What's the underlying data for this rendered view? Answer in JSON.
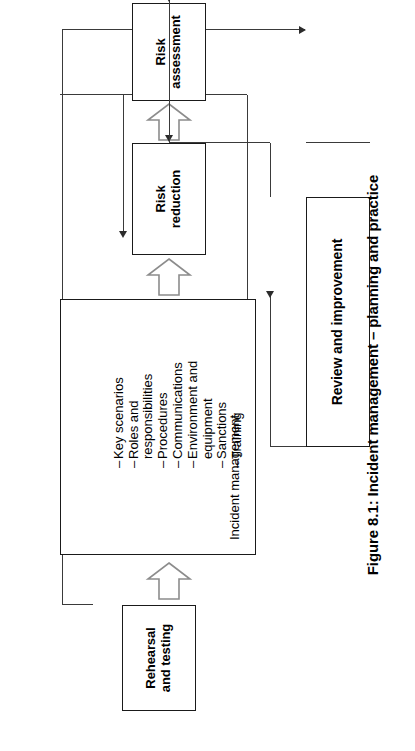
{
  "figure": {
    "caption": "Figure 8.1: Incident management – planning and practice",
    "accent": "#000000",
    "line_color": "#3a3a3a"
  },
  "nodes": {
    "risk_assessment": {
      "line1": "Risk",
      "line2": "assessment"
    },
    "risk_reduction": {
      "line1": "Risk",
      "line2": "reduction"
    },
    "rehearsal": {
      "line1": "Rehearsal",
      "line2": "and testing"
    },
    "review": {
      "label": "Review and improvement"
    },
    "incident": {
      "lead_line1": "Incident",
      "lead_line2": "management",
      "items": [
        "Key scenarios",
        "Roles and",
        "responsibilities",
        "Procedures",
        "Communications",
        "Environment and",
        "equipment",
        "Sanctions",
        "Training"
      ],
      "bullet": "–"
    }
  },
  "flow": {
    "chain": [
      "Risk assessment",
      "Risk reduction",
      "Incident management",
      "Rehearsal and testing"
    ],
    "feedback_from": "Review and improvement",
    "feedback_to": [
      "Incident management",
      "Risk reduction",
      "Risk assessment"
    ],
    "input_to_review_from": "Rehearsal and testing"
  }
}
